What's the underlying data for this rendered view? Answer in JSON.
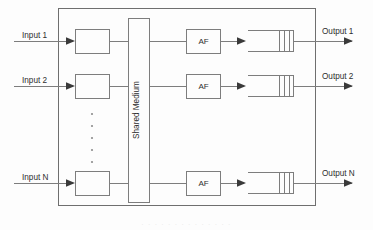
{
  "figure": {
    "type": "block-diagram",
    "background_color": "#fdfdfd",
    "line_color": "#7d7d7d",
    "text_color": "#2e2e2e",
    "frame_color": "#6f6f6f"
  },
  "outer_frame": {
    "label": "switch-fabric-boundary",
    "x": 58,
    "y": 8,
    "width": 258,
    "height": 198
  },
  "shared_medium": {
    "label": "Shared Medium",
    "orientation": "vertical",
    "x": 128,
    "y": 18,
    "width": 22,
    "height": 185
  },
  "rows": [
    {
      "id": "row-1",
      "input_label": "Input 1",
      "output_label": "Output 1",
      "af_label": "AF",
      "y": 41
    },
    {
      "id": "row-2",
      "input_label": "Input 2",
      "output_label": "Output 2",
      "af_label": "AF",
      "y": 86
    },
    {
      "id": "row-n",
      "input_label": "Input N",
      "output_label": "Output N",
      "af_label": "AF",
      "y": 183
    }
  ],
  "ellipsis": {
    "label": "vertical-ellipsis",
    "dot_count": 5,
    "x": 92,
    "y_start": 114,
    "y_step": 12
  },
  "buffer": {
    "label": "output-buffer-queue",
    "divider_count": 3,
    "description": "open-ended queue symbol with three cell dividers"
  },
  "caption": {
    "text": "· · · · · · · · · · · · · ·"
  }
}
